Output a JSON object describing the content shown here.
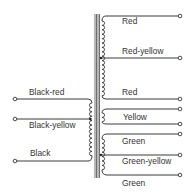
{
  "diagram": {
    "type": "transformer-wiring",
    "colors": {
      "line": "#3a3a3a",
      "text": "#333333",
      "background": "#ffffff"
    },
    "primary": {
      "leads": [
        {
          "label": "Black-red"
        },
        {
          "label": "Black-yellow"
        },
        {
          "label": "Black"
        }
      ]
    },
    "secondary": {
      "leads": [
        {
          "label": "Red"
        },
        {
          "label": "Red-yellow"
        },
        {
          "label": "Red"
        },
        {
          "label": "Yellow"
        },
        {
          "label": "Green"
        },
        {
          "label": "Green-yellow"
        },
        {
          "label": "Green"
        }
      ]
    }
  }
}
